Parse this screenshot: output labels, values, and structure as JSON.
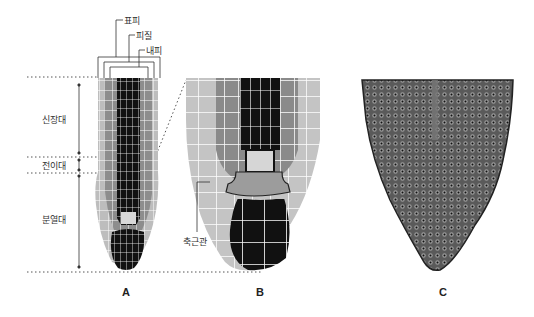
{
  "diagram": {
    "type": "root-tip anatomy",
    "tissue_labels": {
      "epidermis": "표피",
      "cortex": "피질",
      "endodermis": "내피"
    },
    "zone_labels": {
      "elongation": "신장대",
      "transition": "전이대",
      "meristem": "분열대"
    },
    "callout": {
      "root_cap_columella": "축근관"
    },
    "panels": [
      "A",
      "B",
      "C"
    ],
    "colors": {
      "stele": "#111111",
      "cortex_dark": "#8a8a8a",
      "cortex_light": "#b8b8b8",
      "outer_light": "#cfcfcf",
      "cell_wall": "#ffffff",
      "micrograph": "#4a4a4a"
    }
  }
}
